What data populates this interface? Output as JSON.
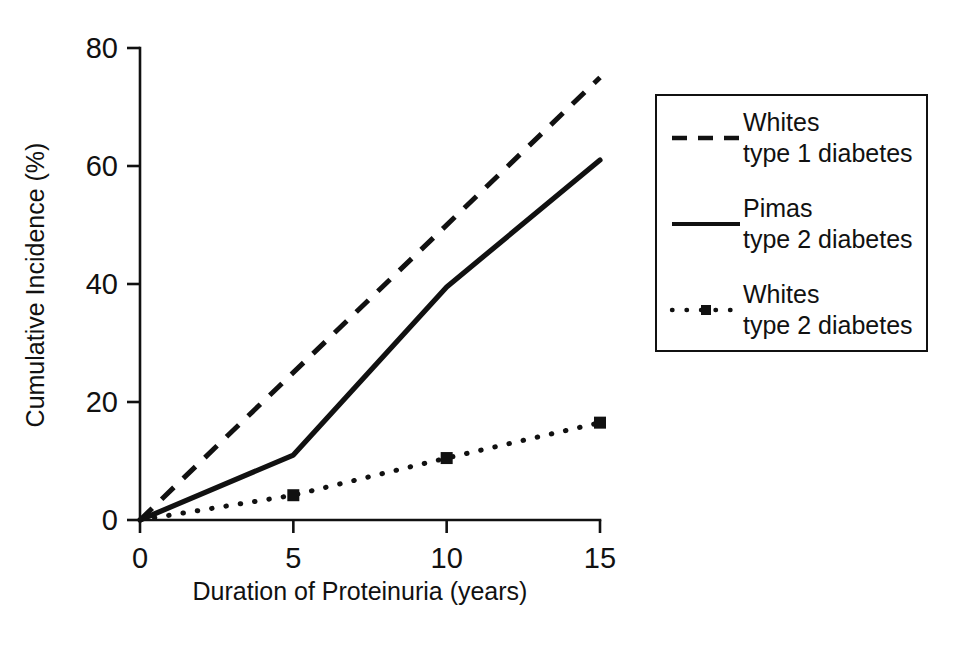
{
  "chart_data": {
    "type": "line",
    "title": "",
    "xlabel": "Duration of Proteinuria (years)",
    "ylabel": "Cumulative Incidence (%)",
    "xlim": [
      0,
      15
    ],
    "ylim": [
      0,
      80
    ],
    "xticks": [
      "0",
      "5",
      "10",
      "15"
    ],
    "xtick_values": [
      0,
      5,
      10,
      15
    ],
    "yticks": [
      "0",
      "20",
      "40",
      "60",
      "80"
    ],
    "ytick_values": [
      0,
      20,
      40,
      60,
      80
    ],
    "grid": false,
    "legend_position": "right",
    "x": [
      0,
      5,
      10,
      15
    ],
    "series": [
      {
        "name": "Whites type 1 diabetes",
        "label_line1": "Whites",
        "label_line2": "type 1 diabetes",
        "style": "dashed",
        "marker": "none",
        "color": "#111111",
        "x": [
          0,
          15
        ],
        "values": [
          0,
          75
        ]
      },
      {
        "name": "Pimas type 2 diabetes",
        "label_line1": "Pimas",
        "label_line2": "type 2 diabetes",
        "style": "solid",
        "marker": "none",
        "color": "#111111",
        "x": [
          0,
          5,
          10,
          15
        ],
        "values": [
          0,
          11,
          39.5,
          61
        ]
      },
      {
        "name": "Whites type 2 diabetes",
        "label_line1": "Whites",
        "label_line2": "type 2 diabetes",
        "style": "dotted",
        "marker": "square",
        "color": "#111111",
        "x": [
          0,
          5,
          10,
          15
        ],
        "values": [
          0,
          4.2,
          10.5,
          16.5
        ]
      }
    ]
  }
}
